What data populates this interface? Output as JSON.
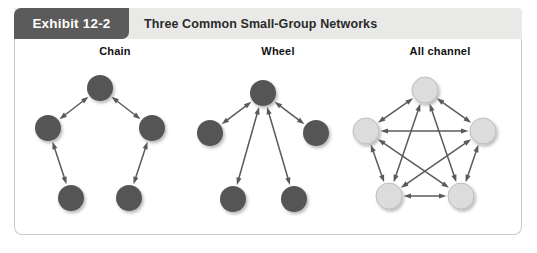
{
  "exhibit": {
    "tab_label": "Exhibit 12-2",
    "title": "Three Common Small-Group Networks"
  },
  "colors": {
    "tab_background": "#5b5b5b",
    "tab_text": "#ffffff",
    "header_background": "#e9e9e7",
    "title_text": "#2b2b2b",
    "panel_border": "#c9c9c9",
    "panel_background": "#ffffff",
    "node_dark": "#555555",
    "node_light": "#dcdcdc",
    "node_light_stroke": "#bdbdbd",
    "arrow": "#5a5a5a",
    "shadow": "rgba(0,0,0,0.22)"
  },
  "networks": [
    {
      "name": "chain",
      "label": "Chain",
      "node_style": "dark",
      "node_radius": 13,
      "nodes": [
        {
          "id": "top",
          "cx": 100,
          "cy": 88
        },
        {
          "id": "left",
          "cx": 48,
          "cy": 128
        },
        {
          "id": "right",
          "cx": 152,
          "cy": 128
        },
        {
          "id": "bottom-left",
          "cx": 71,
          "cy": 198
        },
        {
          "id": "bottom-right",
          "cx": 129,
          "cy": 198
        }
      ],
      "edges": [
        {
          "from": "top",
          "to": "left",
          "arrows": "both"
        },
        {
          "from": "top",
          "to": "right",
          "arrows": "both"
        },
        {
          "from": "left",
          "to": "bottom-left",
          "arrows": "both"
        },
        {
          "from": "right",
          "to": "bottom-right",
          "arrows": "both"
        }
      ]
    },
    {
      "name": "wheel",
      "label": "Wheel",
      "node_style": "dark",
      "node_radius": 13,
      "nodes": [
        {
          "id": "hub",
          "cx": 263,
          "cy": 93
        },
        {
          "id": "left",
          "cx": 210,
          "cy": 133
        },
        {
          "id": "right",
          "cx": 316,
          "cy": 133
        },
        {
          "id": "bottom-left",
          "cx": 233,
          "cy": 199
        },
        {
          "id": "bottom-right",
          "cx": 294,
          "cy": 199
        }
      ],
      "edges": [
        {
          "from": "hub",
          "to": "left",
          "arrows": "both"
        },
        {
          "from": "hub",
          "to": "right",
          "arrows": "both"
        },
        {
          "from": "hub",
          "to": "bottom-left",
          "arrows": "both"
        },
        {
          "from": "hub",
          "to": "bottom-right",
          "arrows": "both"
        }
      ]
    },
    {
      "name": "all-channel",
      "label": "All channel",
      "node_style": "light",
      "node_radius": 13,
      "nodes": [
        {
          "id": "top",
          "cx": 425,
          "cy": 90
        },
        {
          "id": "left",
          "cx": 366,
          "cy": 131
        },
        {
          "id": "right",
          "cx": 483,
          "cy": 131
        },
        {
          "id": "bottom-left",
          "cx": 389,
          "cy": 196
        },
        {
          "id": "bottom-right",
          "cx": 461,
          "cy": 196
        }
      ],
      "edges": [
        {
          "from": "top",
          "to": "left",
          "arrows": "both"
        },
        {
          "from": "top",
          "to": "right",
          "arrows": "both"
        },
        {
          "from": "top",
          "to": "bottom-left",
          "arrows": "both"
        },
        {
          "from": "top",
          "to": "bottom-right",
          "arrows": "both"
        },
        {
          "from": "left",
          "to": "right",
          "arrows": "both"
        },
        {
          "from": "left",
          "to": "bottom-left",
          "arrows": "both"
        },
        {
          "from": "left",
          "to": "bottom-right",
          "arrows": "both"
        },
        {
          "from": "right",
          "to": "bottom-left",
          "arrows": "both"
        },
        {
          "from": "right",
          "to": "bottom-right",
          "arrows": "both"
        },
        {
          "from": "bottom-left",
          "to": "bottom-right",
          "arrows": "both"
        }
      ]
    }
  ]
}
